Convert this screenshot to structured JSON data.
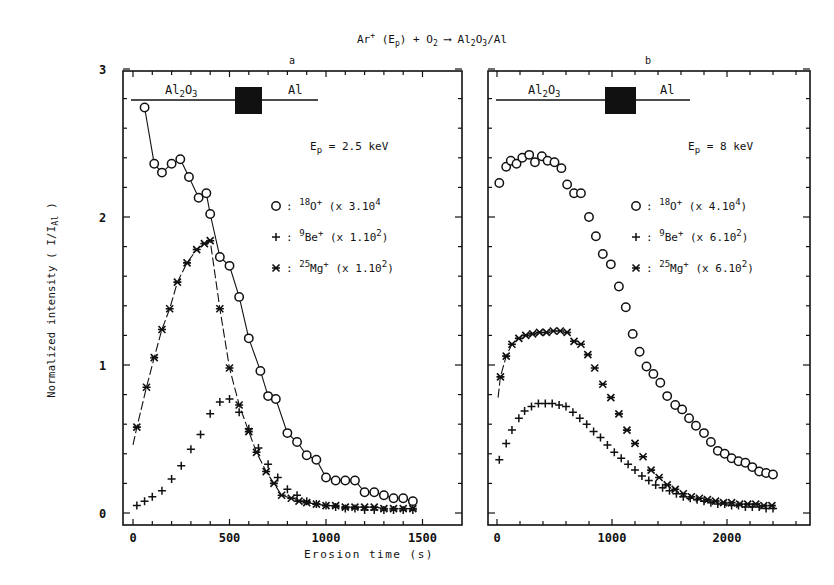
{
  "title_parts": {
    "ion": "Ar",
    "ion_sup": "+",
    "ep": "(E",
    "ep_sub": "p",
    "ep_close": ")",
    "plus": "+ O",
    "o2_sub": "2",
    "arrow": "⟶",
    "product_a": "Al",
    "product_a_sub": "2",
    "product_b": "O",
    "product_b_sub": "3",
    "product_c": "/Al"
  },
  "ylabel": "Normalized intensity ( I/I",
  "ylabel_sub": "Al",
  "ylabel_close": " )",
  "xlabel": "Erosion time (s)",
  "colors": {
    "ink": "#111111",
    "background": "#ffffff",
    "interface_block": "#111111"
  },
  "chart_data": [
    {
      "type": "scatter",
      "panel": "a",
      "title": "a",
      "annotation": "Ep = 2.5 keV",
      "annotation_parts": {
        "e": "E",
        "sub": "p",
        "rest": " = 2.5 keV"
      },
      "layers": {
        "left": "Al2O3",
        "right": "Al"
      },
      "xlabel": "Erosion time (s)",
      "ylabel": "Normalized intensity ( I/IAl )",
      "xlim": [
        0,
        1550
      ],
      "ylim": [
        0,
        3
      ],
      "xticks": [
        0,
        500,
        1000,
        1500
      ],
      "yticks": [
        0,
        1,
        2,
        3
      ],
      "grid": false,
      "legend": [
        {
          "marker": "O",
          "species": "18O+",
          "iso": "18",
          "el": "O",
          "factor": "(x 3.10",
          "exp": "4",
          "close": ""
        },
        {
          "marker": "+",
          "species": "9Be+",
          "iso": "9",
          "el": "Be",
          "factor": "(x 1.10",
          "exp": "2",
          "close": ")"
        },
        {
          "marker": "*",
          "species": "25Mg+",
          "iso": "25",
          "el": "Mg",
          "factor": "(x 1.10",
          "exp": "2",
          "close": ")"
        }
      ],
      "series": [
        {
          "name": "18O+",
          "marker": "circle",
          "line": "solid",
          "x": [
            60,
            110,
            150,
            200,
            245,
            290,
            340,
            380,
            400,
            450,
            500,
            550,
            600,
            660,
            700,
            740,
            800,
            850,
            900,
            950,
            1000,
            1050,
            1100,
            1150,
            1200,
            1250,
            1300,
            1350,
            1400,
            1450
          ],
          "y": [
            2.74,
            2.36,
            2.3,
            2.36,
            2.39,
            2.27,
            2.13,
            2.16,
            2.02,
            1.73,
            1.67,
            1.46,
            1.18,
            0.96,
            0.79,
            0.77,
            0.54,
            0.48,
            0.39,
            0.36,
            0.24,
            0.22,
            0.22,
            0.22,
            0.14,
            0.14,
            0.12,
            0.1,
            0.1,
            0.08,
            0.07
          ]
        },
        {
          "name": "9Be+",
          "marker": "plus",
          "line": "none",
          "x": [
            20,
            60,
            100,
            150,
            200,
            250,
            300,
            350,
            400,
            450,
            500,
            550,
            600,
            650,
            700,
            750,
            800,
            850,
            900,
            950,
            1000,
            1050,
            1100,
            1150,
            1200,
            1250,
            1300,
            1350,
            1400,
            1450
          ],
          "y": [
            0.05,
            0.08,
            0.11,
            0.15,
            0.23,
            0.32,
            0.43,
            0.53,
            0.67,
            0.75,
            0.77,
            0.68,
            0.57,
            0.44,
            0.33,
            0.24,
            0.16,
            0.12,
            0.08,
            0.06,
            0.05,
            0.04,
            0.03,
            0.03,
            0.02,
            0.02,
            0.02,
            0.02,
            0.02,
            0.02
          ]
        },
        {
          "name": "25Mg+",
          "marker": "asterisk",
          "line": "dashed",
          "x": [
            20,
            70,
            110,
            150,
            190,
            230,
            280,
            330,
            370,
            400,
            450,
            500,
            550,
            600,
            640,
            690,
            730,
            770,
            820,
            860,
            900,
            950,
            1000,
            1050,
            1100,
            1150,
            1200,
            1250,
            1300,
            1350,
            1400,
            1450
          ],
          "y": [
            0.58,
            0.85,
            1.05,
            1.24,
            1.38,
            1.56,
            1.69,
            1.78,
            1.82,
            1.84,
            1.38,
            0.98,
            0.73,
            0.55,
            0.41,
            0.28,
            0.2,
            0.12,
            0.1,
            0.08,
            0.07,
            0.06,
            0.05,
            0.05,
            0.04,
            0.04,
            0.04,
            0.04,
            0.03,
            0.03,
            0.03,
            0.03
          ]
        }
      ]
    },
    {
      "type": "scatter",
      "panel": "b",
      "title": "b",
      "annotation": "Ep = 8 keV",
      "annotation_parts": {
        "e": "E",
        "sub": "p",
        "rest": " = 8 keV"
      },
      "layers": {
        "left": "Al2O3",
        "right": "Al"
      },
      "xlabel": "",
      "xlim": [
        0,
        2600
      ],
      "ylim": [
        0,
        3
      ],
      "xticks": [
        0,
        1000,
        2000
      ],
      "yticks": [
        0,
        1,
        2,
        3
      ],
      "grid": false,
      "legend": [
        {
          "marker": "O",
          "species": "18O+",
          "iso": "18",
          "el": "O",
          "factor": "(x 4.10",
          "exp": "4",
          "close": ")"
        },
        {
          "marker": "+",
          "species": "9Be+",
          "iso": "9",
          "el": "Be",
          "factor": "(x 6.10",
          "exp": "2",
          "close": ")"
        },
        {
          "marker": "*",
          "species": "25Mg+",
          "iso": "25",
          "el": "Mg",
          "factor": "(x 6.10",
          "exp": "2",
          "close": ")"
        }
      ],
      "series": [
        {
          "name": "18O+",
          "marker": "circle",
          "line": "none",
          "x": [
            20,
            80,
            120,
            170,
            220,
            280,
            330,
            390,
            440,
            500,
            560,
            610,
            670,
            730,
            800,
            860,
            920,
            990,
            1060,
            1120,
            1180,
            1240,
            1300,
            1360,
            1420,
            1480,
            1550,
            1610,
            1670,
            1730,
            1800,
            1860,
            1920,
            1980,
            2040,
            2100,
            2160,
            2220,
            2280,
            2340,
            2400
          ],
          "y": [
            2.23,
            2.34,
            2.38,
            2.36,
            2.4,
            2.42,
            2.37,
            2.41,
            2.38,
            2.37,
            2.33,
            2.22,
            2.16,
            2.16,
            2.0,
            1.87,
            1.75,
            1.68,
            1.53,
            1.39,
            1.21,
            1.09,
            0.99,
            0.94,
            0.88,
            0.79,
            0.73,
            0.7,
            0.64,
            0.59,
            0.54,
            0.48,
            0.42,
            0.4,
            0.37,
            0.35,
            0.34,
            0.31,
            0.28,
            0.27,
            0.26,
            0.25,
            0.22
          ]
        },
        {
          "name": "9Be+",
          "marker": "plus",
          "line": "none",
          "x": [
            20,
            80,
            130,
            190,
            240,
            300,
            360,
            420,
            480,
            540,
            600,
            660,
            720,
            780,
            840,
            900,
            960,
            1020,
            1080,
            1140,
            1200,
            1260,
            1320,
            1380,
            1440,
            1500,
            1560,
            1620,
            1680,
            1740,
            1800,
            1860,
            1920,
            1980,
            2040,
            2100,
            2160,
            2220,
            2280,
            2340,
            2400
          ],
          "y": [
            0.36,
            0.47,
            0.56,
            0.64,
            0.69,
            0.72,
            0.74,
            0.74,
            0.74,
            0.73,
            0.72,
            0.68,
            0.64,
            0.6,
            0.55,
            0.51,
            0.46,
            0.41,
            0.37,
            0.33,
            0.29,
            0.25,
            0.22,
            0.19,
            0.17,
            0.15,
            0.13,
            0.11,
            0.1,
            0.09,
            0.08,
            0.07,
            0.06,
            0.06,
            0.05,
            0.05,
            0.04,
            0.04,
            0.04,
            0.03,
            0.03
          ]
        },
        {
          "name": "25Mg+",
          "marker": "asterisk",
          "line": "dashed",
          "x": [
            30,
            80,
            130,
            190,
            250,
            310,
            370,
            430,
            490,
            550,
            610,
            670,
            730,
            790,
            850,
            920,
            990,
            1060,
            1130,
            1200,
            1270,
            1340,
            1410,
            1480,
            1550,
            1620,
            1690,
            1760,
            1830,
            1900,
            1970,
            2040,
            2110,
            2180,
            2250,
            2320,
            2390
          ],
          "y": [
            0.92,
            1.06,
            1.14,
            1.18,
            1.2,
            1.21,
            1.22,
            1.22,
            1.23,
            1.23,
            1.22,
            1.16,
            1.14,
            1.07,
            0.98,
            0.87,
            0.78,
            0.67,
            0.56,
            0.47,
            0.38,
            0.29,
            0.24,
            0.19,
            0.16,
            0.13,
            0.11,
            0.1,
            0.09,
            0.08,
            0.07,
            0.07,
            0.06,
            0.06,
            0.06,
            0.05,
            0.05
          ]
        }
      ]
    }
  ]
}
